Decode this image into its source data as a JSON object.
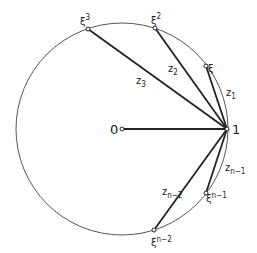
{
  "diagram": {
    "title": "",
    "circle": {
      "cx": 122,
      "cy": 129,
      "r": 106,
      "stroke": "#444444"
    },
    "origin": {
      "x": 122,
      "y": 129,
      "label": "0"
    },
    "one": {
      "x": 227,
      "y": 129,
      "label": "1"
    },
    "points": [
      {
        "id": "xi3",
        "x": 88,
        "y": 29,
        "base": "ξ",
        "sup": "3"
      },
      {
        "id": "xi2",
        "x": 155,
        "y": 28,
        "base": "ξ",
        "sup": "2"
      },
      {
        "id": "xi1",
        "x": 206,
        "y": 66,
        "base": "ξ",
        "sup": ""
      },
      {
        "id": "xin1",
        "x": 206,
        "y": 193,
        "base": "ξ",
        "sup": "n−1"
      },
      {
        "id": "xin2",
        "x": 154,
        "y": 230,
        "base": "ξ",
        "sup": "n−2"
      }
    ],
    "chords": [
      {
        "id": "z3",
        "base": "z",
        "sub": "3"
      },
      {
        "id": "z2",
        "base": "z",
        "sub": "2"
      },
      {
        "id": "z1",
        "base": "z",
        "sub": "1"
      },
      {
        "id": "zn1",
        "base": "z",
        "sub": "n−1"
      },
      {
        "id": "zn2",
        "base": "z",
        "sub": "n−2"
      }
    ],
    "colors": {
      "line": "#222222",
      "circle": "#555555",
      "text": "#222222"
    }
  }
}
